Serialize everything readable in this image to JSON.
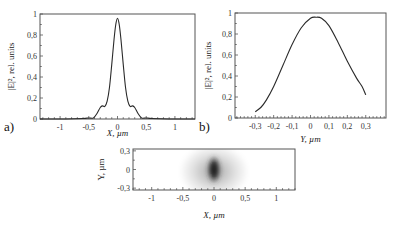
{
  "chart_data": [
    {
      "id": "a",
      "type": "line",
      "panel_label": "a)",
      "title": "",
      "xlabel": "X, µm",
      "ylabel": "|E|², rel. units",
      "xlim": [
        -1.35,
        1.35
      ],
      "ylim": [
        0,
        1
      ],
      "xticks": [
        -1,
        -0.5,
        0,
        0.5,
        1
      ],
      "xtick_labels": [
        "-1",
        "-0,5",
        "0",
        "0,5",
        "1"
      ],
      "yticks": [
        0,
        0.2,
        0.4,
        0.6,
        0.8,
        1
      ],
      "ytick_labels": [
        "0",
        "0,2",
        "0,4",
        "0,6",
        "0,8",
        "1"
      ],
      "grid": false,
      "x": [
        -1.35,
        -0.9,
        -0.6,
        -0.5,
        -0.42,
        -0.36,
        -0.3,
        -0.26,
        -0.22,
        -0.18,
        -0.14,
        -0.1,
        -0.06,
        -0.03,
        0,
        0.03,
        0.06,
        0.1,
        0.14,
        0.18,
        0.22,
        0.26,
        0.3,
        0.36,
        0.42,
        0.5,
        0.6,
        0.9,
        1.35
      ],
      "y": [
        0,
        0,
        0.005,
        0.01,
        0.01,
        0.05,
        0.11,
        0.125,
        0.12,
        0.17,
        0.3,
        0.52,
        0.76,
        0.9,
        0.96,
        0.9,
        0.76,
        0.52,
        0.3,
        0.17,
        0.12,
        0.125,
        0.11,
        0.05,
        0.01,
        0.01,
        0.005,
        0,
        0
      ]
    },
    {
      "id": "b",
      "type": "line",
      "panel_label": "b)",
      "title": "",
      "xlabel": "Y, µm",
      "ylabel": "|E|², rel. units",
      "xlim": [
        -0.41,
        0.41
      ],
      "ylim": [
        0,
        1
      ],
      "xticks": [
        -0.3,
        -0.2,
        -0.1,
        0,
        0.1,
        0.2,
        0.3
      ],
      "xtick_labels": [
        "-0,3",
        "-0,2",
        "-0,1",
        "0",
        "0,1",
        "0,2",
        "0,3"
      ],
      "yticks": [
        0,
        0.2,
        0.4,
        0.6,
        0.8,
        1
      ],
      "ytick_labels": [
        "0",
        "0,2",
        "0,4",
        "0,6",
        "0,8",
        "1"
      ],
      "grid": false,
      "x": [
        -0.3,
        -0.27,
        -0.24,
        -0.2,
        -0.15,
        -0.1,
        -0.05,
        0,
        0.03,
        0.06,
        0.1,
        0.15,
        0.2,
        0.25,
        0.28,
        0.3
      ],
      "y": [
        0.06,
        0.1,
        0.17,
        0.3,
        0.5,
        0.7,
        0.86,
        0.95,
        0.96,
        0.95,
        0.88,
        0.72,
        0.54,
        0.38,
        0.3,
        0.22
      ]
    },
    {
      "id": "c",
      "type": "heatmap",
      "panel_label": "",
      "title": "",
      "xlabel": "X, µm",
      "ylabel": "Y, µm",
      "xlim": [
        -1.3,
        1.3
      ],
      "ylim": [
        -0.33,
        0.33
      ],
      "xticks": [
        -1,
        -0.5,
        0,
        0.5,
        1
      ],
      "xtick_labels": [
        "-1",
        "-0,5",
        "0",
        "0,5",
        "1"
      ],
      "yticks": [
        -0.3,
        0,
        0.3
      ],
      "ytick_labels": [
        "-0,3",
        "0",
        "0,3"
      ],
      "grid": false,
      "colormap": "grayscale (dark = high intensity)",
      "spot": {
        "center_x": 0,
        "center_y": 0.0,
        "sigma_x": 0.1,
        "sigma_y": 0.14,
        "halo_sigma_x": 0.28,
        "halo_sigma_y": 0.2
      }
    }
  ],
  "colors": {
    "line": "#2a2a2a",
    "axes": "#555555",
    "background": "#ffffff"
  }
}
